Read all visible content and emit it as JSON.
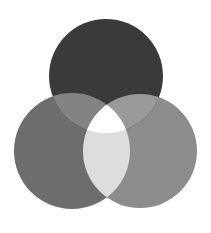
{
  "diagram": {
    "type": "three-circle-venn",
    "background": "#ffffff",
    "circles": {
      "top": {
        "cx": 106,
        "cy": 76,
        "r": 57,
        "fill": "#3a3a3a"
      },
      "left": {
        "cx": 72,
        "cy": 151,
        "r": 58,
        "fill": "#6d6d6d"
      },
      "right": {
        "cx": 140,
        "cy": 151,
        "r": 57,
        "fill": "#8c8c8c"
      }
    },
    "overlaps": {
      "top_left": "#838383",
      "top_right": "#9a9a9a",
      "left_right": "#dddddd",
      "all_three": "#ffffff"
    }
  }
}
